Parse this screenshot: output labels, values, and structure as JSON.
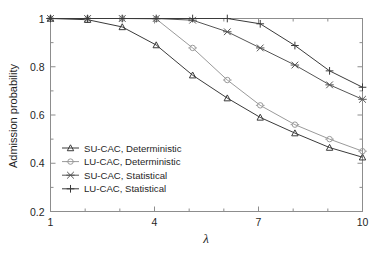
{
  "chart_data": {
    "type": "line",
    "title": "",
    "xlabel": "λ",
    "ylabel": "Admission probability",
    "xlim": [
      1,
      10
    ],
    "ylim": [
      0.2,
      1.0
    ],
    "x_ticks_major": [
      1,
      4,
      7,
      10
    ],
    "x_tick_labels": [
      "1",
      "4",
      "7",
      "10"
    ],
    "x_ticks_minor": [
      2,
      3,
      5,
      6,
      8,
      9
    ],
    "y_ticks_major": [
      0.2,
      0.4,
      0.6,
      0.8,
      1.0
    ],
    "y_tick_labels": [
      "0.2",
      "0.4",
      "0.6",
      "0.8",
      "1"
    ],
    "y_ticks_minor": [
      0.3,
      0.5,
      0.7,
      0.9
    ],
    "grid": false,
    "legend_position": "lower-left-inside",
    "x": [
      1,
      2.07,
      3.07,
      4.05,
      5.1,
      6.1,
      7.05,
      8.05,
      9.05,
      10
    ],
    "series": [
      {
        "name": "SU-CAC, Deterministic",
        "marker": "triangle-up",
        "color": "#3a3a3a",
        "values": [
          1.0,
          0.995,
          0.965,
          0.89,
          0.765,
          0.67,
          0.59,
          0.525,
          0.465,
          0.425
        ]
      },
      {
        "name": "LU-CAC, Deterministic",
        "marker": "circle",
        "color": "#9a9a9a",
        "values": [
          1.0,
          1.0,
          1.0,
          0.998,
          0.878,
          0.745,
          0.64,
          0.56,
          0.5,
          0.45
        ]
      },
      {
        "name": "SU-CAC, Statistical",
        "marker": "asterisk",
        "color": "#555555",
        "values": [
          1.0,
          1.0,
          1.0,
          1.0,
          0.993,
          0.945,
          0.878,
          0.807,
          0.725,
          0.665
        ]
      },
      {
        "name": "LU-CAC, Statistical",
        "marker": "plus",
        "color": "#3a3a3a",
        "values": [
          1.0,
          1.0,
          1.0,
          1.0,
          1.0,
          1.0,
          0.978,
          0.888,
          0.783,
          0.715
        ]
      }
    ]
  },
  "legend": {
    "entries": [
      {
        "label": "SU-CAC, Deterministic"
      },
      {
        "label": "LU-CAC, Deterministic"
      },
      {
        "label": "SU-CAC, Statistical"
      },
      {
        "label": "LU-CAC, Statistical"
      }
    ]
  },
  "axes": {
    "y_axis_title": "Admission probability",
    "x_axis_title": "λ"
  }
}
